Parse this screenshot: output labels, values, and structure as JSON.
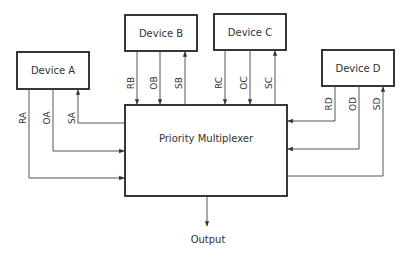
{
  "diagram": {
    "type": "block-diagram",
    "central_block": {
      "id": "mux",
      "label": "Priority Multiplexer"
    },
    "devices": [
      {
        "id": "A",
        "label": "Device A",
        "signals": [
          {
            "name": "RA",
            "direction": "to-mux"
          },
          {
            "name": "OA",
            "direction": "to-mux"
          },
          {
            "name": "SA",
            "direction": "from-mux"
          }
        ]
      },
      {
        "id": "B",
        "label": "Device B",
        "signals": [
          {
            "name": "RB",
            "direction": "to-mux"
          },
          {
            "name": "OB",
            "direction": "to-mux"
          },
          {
            "name": "SB",
            "direction": "from-mux"
          }
        ]
      },
      {
        "id": "C",
        "label": "Device C",
        "signals": [
          {
            "name": "RC",
            "direction": "to-mux"
          },
          {
            "name": "OC",
            "direction": "to-mux"
          },
          {
            "name": "SC",
            "direction": "from-mux"
          }
        ]
      },
      {
        "id": "D",
        "label": "Device D",
        "signals": [
          {
            "name": "RD",
            "direction": "to-mux"
          },
          {
            "name": "OD",
            "direction": "to-mux"
          },
          {
            "name": "SD",
            "direction": "from-mux"
          }
        ]
      }
    ],
    "output": {
      "label": "Output"
    }
  },
  "labels": {
    "mux": "Priority Multiplexer",
    "deviceA": "Device A",
    "deviceB": "Device B",
    "deviceC": "Device C",
    "deviceD": "Device D",
    "output": "Output",
    "RA": "RA",
    "OA": "OA",
    "SA": "SA",
    "RB": "RB",
    "OB": "OB",
    "SB": "SB",
    "RC": "RC",
    "OC": "OC",
    "SC": "SC",
    "RD": "RD",
    "OD": "OD",
    "SD": "SD"
  },
  "colors": {
    "line": "#444444",
    "box_border": "#222222",
    "text": "#333333",
    "background": "#ffffff"
  }
}
